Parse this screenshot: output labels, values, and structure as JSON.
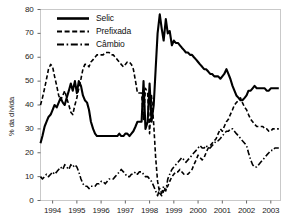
{
  "chart_data": {
    "type": "line",
    "title": "",
    "subtitle": "",
    "xlabel": "",
    "ylabel": "% da dívida",
    "ylim": [
      0,
      80
    ],
    "xlim": [
      1994.0,
      2003.9
    ],
    "yticks": [
      0,
      10,
      20,
      30,
      40,
      50,
      60,
      70,
      80
    ],
    "ytick_labels": [
      "0",
      "10",
      "20",
      "30",
      "40",
      "50",
      "60",
      "70",
      "80"
    ],
    "xticks": [
      1994,
      1995,
      1996,
      1997,
      1998,
      1999,
      2000,
      2001,
      2002,
      2003
    ],
    "xtick_labels": [
      "1994",
      "1995",
      "1996",
      "1997",
      "1998",
      "1999",
      "2000",
      "2001",
      "2002",
      "2003"
    ],
    "grid": false,
    "legend_position": "upper-left-inside",
    "legend": [
      "Selic",
      "Prefixada",
      "Câmbio"
    ],
    "series": [
      {
        "name": "Selic",
        "style": "solid",
        "width": 2.1,
        "color": "#000000",
        "x": [
          1994.0,
          1994.08,
          1994.17,
          1994.25,
          1994.33,
          1994.42,
          1994.5,
          1994.58,
          1994.67,
          1994.75,
          1994.83,
          1994.92,
          1995.0,
          1995.08,
          1995.17,
          1995.25,
          1995.33,
          1995.42,
          1995.5,
          1995.58,
          1995.67,
          1995.75,
          1995.83,
          1995.92,
          1996.0,
          1996.08,
          1996.17,
          1996.25,
          1996.33,
          1996.42,
          1996.5,
          1996.58,
          1996.67,
          1996.75,
          1996.83,
          1996.92,
          1997.0,
          1997.08,
          1997.17,
          1997.25,
          1997.33,
          1997.42,
          1997.5,
          1997.58,
          1997.67,
          1997.75,
          1997.83,
          1997.92,
          1998.0,
          1998.08,
          1998.17,
          1998.25,
          1998.33,
          1998.42,
          1998.5,
          1998.58,
          1998.67,
          1998.75,
          1998.83,
          1998.92,
          1999.0,
          1999.08,
          1999.17,
          1999.25,
          1999.33,
          1999.42,
          1999.5,
          1999.58,
          1999.67,
          1999.75,
          1999.83,
          1999.92,
          2000.0,
          2000.08,
          2000.17,
          2000.25,
          2000.33,
          2000.42,
          2000.5,
          2000.58,
          2000.67,
          2000.75,
          2000.83,
          2000.92,
          2001.0,
          2001.08,
          2001.17,
          2001.25,
          2001.33,
          2001.42,
          2001.5,
          2001.58,
          2001.67,
          2001.75,
          2001.83,
          2001.92,
          2002.0,
          2002.08,
          2002.17,
          2002.25,
          2002.33,
          2002.42,
          2002.5,
          2002.58,
          2002.67,
          2002.75,
          2002.83,
          2002.92,
          2003.0,
          2003.08,
          2003.17,
          2003.25,
          2003.33,
          2003.42,
          2003.5,
          2003.58,
          2003.67,
          2003.75,
          2003.83
        ],
        "y": [
          24,
          27,
          31,
          33,
          35,
          36,
          38,
          40,
          39,
          41,
          43,
          41,
          40,
          43,
          46,
          49,
          46,
          50,
          45,
          50,
          48,
          44,
          42,
          41,
          38,
          33,
          30,
          28,
          27,
          27,
          27,
          27,
          27,
          27,
          27,
          27,
          27,
          27,
          27,
          28,
          27,
          27,
          28,
          28,
          27,
          28,
          29,
          31,
          33,
          33,
          33,
          50,
          30,
          33,
          49,
          33,
          40,
          55,
          70,
          78,
          72,
          67,
          76,
          70,
          71,
          65,
          67,
          66,
          66,
          65,
          64,
          63,
          62,
          62,
          61,
          61,
          60,
          59,
          58,
          57,
          56,
          55,
          55,
          54,
          53,
          53,
          52,
          52,
          52,
          51,
          52,
          53,
          55,
          53,
          51,
          48,
          46,
          44,
          43,
          42,
          42,
          43,
          44,
          46,
          46,
          47,
          48,
          47,
          47,
          47,
          47,
          47,
          46,
          46,
          47,
          47,
          47,
          47,
          47
        ]
      },
      {
        "name": "Prefixada",
        "style": "dashed",
        "width": 1.6,
        "color": "#000000",
        "x": [
          1994.0,
          1994.08,
          1994.17,
          1994.25,
          1994.33,
          1994.42,
          1994.5,
          1994.58,
          1994.67,
          1994.75,
          1994.83,
          1994.92,
          1995.0,
          1995.08,
          1995.17,
          1995.25,
          1995.33,
          1995.42,
          1995.5,
          1995.58,
          1995.67,
          1995.75,
          1995.83,
          1995.92,
          1996.0,
          1996.08,
          1996.17,
          1996.25,
          1996.33,
          1996.42,
          1996.5,
          1996.58,
          1996.67,
          1996.75,
          1996.83,
          1996.92,
          1997.0,
          1997.08,
          1997.17,
          1997.25,
          1997.33,
          1997.42,
          1997.5,
          1997.58,
          1997.67,
          1997.75,
          1997.83,
          1997.92,
          1998.0,
          1998.08,
          1998.17,
          1998.25,
          1998.33,
          1998.42,
          1998.5,
          1998.58,
          1998.67,
          1998.75,
          1998.83,
          1998.92,
          1999.0,
          1999.08,
          1999.17,
          1999.25,
          1999.33,
          1999.42,
          1999.5,
          1999.58,
          1999.67,
          1999.75,
          1999.83,
          1999.92,
          2000.0,
          2000.08,
          2000.17,
          2000.25,
          2000.33,
          2000.42,
          2000.5,
          2000.58,
          2000.67,
          2000.75,
          2000.83,
          2000.92,
          2001.0,
          2001.08,
          2001.17,
          2001.25,
          2001.33,
          2001.42,
          2001.5,
          2001.58,
          2001.67,
          2001.75,
          2001.83,
          2001.92,
          2002.0,
          2002.08,
          2002.17,
          2002.25,
          2002.33,
          2002.42,
          2002.5,
          2002.58,
          2002.67,
          2002.75,
          2002.83,
          2002.92,
          2003.0,
          2003.08,
          2003.17,
          2003.25,
          2003.33,
          2003.42,
          2003.5,
          2003.58,
          2003.67,
          2003.75,
          2003.83
        ],
        "y": [
          40,
          43,
          47,
          51,
          55,
          57,
          56,
          52,
          48,
          44,
          42,
          44,
          46,
          43,
          40,
          37,
          36,
          40,
          43,
          47,
          51,
          55,
          57,
          57,
          56,
          58,
          59,
          60,
          61,
          61,
          61,
          61,
          62,
          62,
          62,
          61,
          61,
          60,
          59,
          58,
          57,
          56,
          57,
          58,
          58,
          57,
          55,
          50,
          45,
          45,
          45,
          34,
          47,
          45,
          28,
          44,
          32,
          18,
          8,
          3,
          2,
          4,
          5,
          6,
          8,
          10,
          11,
          12,
          12,
          13,
          12,
          11,
          11,
          11,
          12,
          13,
          15,
          17,
          19,
          18,
          17,
          18,
          20,
          22,
          23,
          24,
          25,
          26,
          28,
          30,
          29,
          31,
          33,
          34,
          36,
          38,
          40,
          41,
          42,
          43,
          41,
          39,
          38,
          36,
          34,
          33,
          32,
          31,
          31,
          31,
          31,
          30,
          30,
          29,
          29,
          30,
          30,
          30,
          30
        ]
      },
      {
        "name": "Câmbio",
        "style": "dashdot",
        "width": 1.6,
        "color": "#000000",
        "x": [
          1994.0,
          1994.08,
          1994.17,
          1994.25,
          1994.33,
          1994.42,
          1994.5,
          1994.58,
          1994.67,
          1994.75,
          1994.83,
          1994.92,
          1995.0,
          1995.08,
          1995.17,
          1995.25,
          1995.33,
          1995.42,
          1995.5,
          1995.58,
          1995.67,
          1995.75,
          1995.83,
          1995.92,
          1996.0,
          1996.08,
          1996.17,
          1996.25,
          1996.33,
          1996.42,
          1996.5,
          1996.58,
          1996.67,
          1996.75,
          1996.83,
          1996.92,
          1997.0,
          1997.08,
          1997.17,
          1997.25,
          1997.33,
          1997.42,
          1997.5,
          1997.58,
          1997.67,
          1997.75,
          1997.83,
          1997.92,
          1998.0,
          1998.08,
          1998.17,
          1998.25,
          1998.33,
          1998.42,
          1998.5,
          1998.58,
          1998.67,
          1998.75,
          1998.83,
          1998.92,
          1999.0,
          1999.08,
          1999.17,
          1999.25,
          1999.33,
          1999.42,
          1999.5,
          1999.58,
          1999.67,
          1999.75,
          1999.83,
          1999.92,
          2000.0,
          2000.08,
          2000.17,
          2000.25,
          2000.33,
          2000.42,
          2000.5,
          2000.58,
          2000.67,
          2000.75,
          2000.83,
          2000.92,
          2001.0,
          2001.08,
          2001.17,
          2001.25,
          2001.33,
          2001.42,
          2001.5,
          2001.58,
          2001.67,
          2001.75,
          2001.83,
          2001.92,
          2002.0,
          2002.08,
          2002.17,
          2002.25,
          2002.33,
          2002.42,
          2002.5,
          2002.58,
          2002.67,
          2002.75,
          2002.83,
          2002.92,
          2003.0,
          2003.08,
          2003.17,
          2003.25,
          2003.33,
          2003.42,
          2003.5,
          2003.58,
          2003.67,
          2003.75,
          2003.83
        ],
        "y": [
          10,
          9,
          10,
          11,
          10,
          11,
          12,
          11,
          12,
          13,
          14,
          13,
          15,
          14,
          13,
          15,
          14,
          15,
          14,
          12,
          9,
          7,
          6,
          6,
          5,
          6,
          6,
          6,
          7,
          7,
          8,
          8,
          7,
          8,
          9,
          9,
          9,
          10,
          11,
          12,
          13,
          12,
          11,
          10,
          10,
          11,
          11,
          12,
          11,
          12,
          12,
          11,
          10,
          10,
          9,
          8,
          6,
          4,
          2,
          5,
          3,
          6,
          4,
          9,
          11,
          13,
          14,
          15,
          16,
          17,
          18,
          17,
          16,
          17,
          18,
          19,
          20,
          21,
          22,
          23,
          22,
          22,
          23,
          22,
          22,
          23,
          24,
          25,
          25,
          26,
          27,
          28,
          29,
          29,
          30,
          30,
          29,
          28,
          27,
          26,
          25,
          24,
          23,
          20,
          17,
          15,
          14,
          14,
          15,
          16,
          17,
          18,
          19,
          20,
          21,
          21,
          22,
          22,
          22
        ]
      }
    ]
  },
  "axes": {
    "ylabel": "% da dívida"
  }
}
